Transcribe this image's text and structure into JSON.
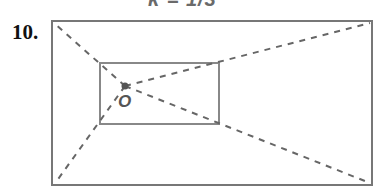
{
  "caption": "k = 1/3",
  "problem_number": "10.",
  "diagram": {
    "center_label": "O",
    "center": [
      125,
      86
    ],
    "outer_rect": {
      "x1": 52,
      "y1": 21,
      "x2": 372,
      "y2": 185
    },
    "inner_rect": {
      "x1": 100,
      "y1": 63,
      "x2": 219,
      "y2": 124
    },
    "colors": {
      "stroke": "#777777",
      "dash": "#666666",
      "text": "#111111"
    }
  }
}
